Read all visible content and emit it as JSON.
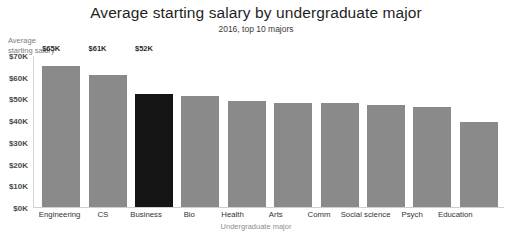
{
  "top_sliver_text": "—",
  "chart_data": {
    "type": "bar",
    "title": "Average starting salary by undergraduate major",
    "subtitle": "2016, top 10 majors",
    "xlabel": "Undergraduate major",
    "ylabel": "Average\nstarting salary",
    "ylim": [
      0,
      70
    ],
    "grid": false,
    "legend": "none",
    "value_unit": "K",
    "value_prefix": "$",
    "bar_color": "#8a8a8a",
    "highlight_color": "#141414",
    "highlight_category": "Business",
    "ytick_labels": [
      "$70K",
      "$60K",
      "$50K",
      "$40K",
      "$30K",
      "$20K",
      "$10K",
      "$0K"
    ],
    "ytick_values": [
      70,
      60,
      50,
      40,
      30,
      20,
      10,
      0
    ],
    "categories": [
      "Engineering",
      "CS",
      "Business",
      "Bio",
      "Health",
      "Arts",
      "Comm",
      "Social science",
      "Psych",
      "Education"
    ],
    "values": [
      65,
      61,
      52,
      51,
      49,
      48,
      48,
      47,
      46,
      39
    ],
    "bars": [
      {
        "category": "Engineering",
        "value": 65,
        "label": "$65K",
        "show_label": true,
        "highlight": false
      },
      {
        "category": "CS",
        "value": 61,
        "label": "$61K",
        "show_label": true,
        "highlight": false
      },
      {
        "category": "Business",
        "value": 52,
        "label": "$52K",
        "show_label": true,
        "highlight": true
      },
      {
        "category": "Bio",
        "value": 51,
        "label": "",
        "show_label": false,
        "highlight": false
      },
      {
        "category": "Health",
        "value": 49,
        "label": "",
        "show_label": false,
        "highlight": false
      },
      {
        "category": "Arts",
        "value": 48,
        "label": "",
        "show_label": false,
        "highlight": false
      },
      {
        "category": "Comm",
        "value": 48,
        "label": "",
        "show_label": false,
        "highlight": false
      },
      {
        "category": "Social science",
        "value": 47,
        "label": "",
        "show_label": false,
        "highlight": false
      },
      {
        "category": "Psych",
        "value": 46,
        "label": "",
        "show_label": false,
        "highlight": false
      },
      {
        "category": "Education",
        "value": 39,
        "label": "",
        "show_label": false,
        "highlight": false
      }
    ]
  }
}
